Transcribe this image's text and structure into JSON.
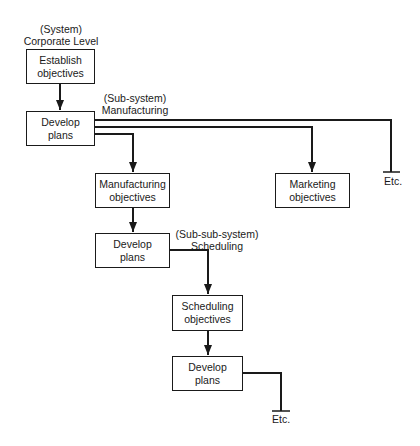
{
  "diagram": {
    "levels": {
      "system": {
        "tag": "(System)",
        "name": "Corporate Level"
      },
      "subsystem": {
        "tag": "(Sub-system)",
        "name": "Manufacturing"
      },
      "subsubsystem": {
        "tag": "(Sub-sub-system)",
        "name": "Scheduling"
      }
    },
    "nodes": {
      "establish_objectives": {
        "line1": "Establish",
        "line2": "objectives"
      },
      "develop_plans_corporate": {
        "line1": "Develop",
        "line2": "plans"
      },
      "manufacturing_objectives": {
        "line1": "Manufacturing",
        "line2": "objectives"
      },
      "marketing_objectives": {
        "line1": "Marketing",
        "line2": "objectives"
      },
      "develop_plans_manufacturing": {
        "line1": "Develop",
        "line2": "plans"
      },
      "scheduling_objectives": {
        "line1": "Scheduling",
        "line2": "objectives"
      },
      "develop_plans_scheduling": {
        "line1": "Develop",
        "line2": "plans"
      }
    },
    "etc_labels": {
      "corporate_etc": "Etc.",
      "scheduling_etc": "Etc."
    },
    "line_color": "#1a1a1a"
  }
}
